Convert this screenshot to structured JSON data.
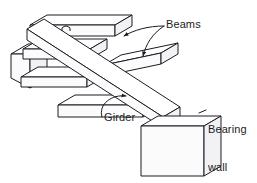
{
  "figure": {
    "kind": "isometric-line-drawing",
    "background_color": "#ffffff",
    "line_color": "#1b1b24",
    "fill_top": "#ffffff",
    "fill_side": "#fbfbfc",
    "fill_end": "#f2f2f4",
    "fill_wall": "#f4f4f6"
  },
  "labels": {
    "beams": "Beams",
    "girder": "Girder",
    "bearing_wall_line1": "Bearing",
    "bearing_wall_line2": "wall",
    "cropped_top_text": ""
  },
  "leaders": {
    "beams_count": 2,
    "girder_count": 1,
    "style": "curved with solid arrowhead"
  },
  "members": [
    {
      "name": "girder",
      "role": "primary diagonal member",
      "orientation": "upper-left to lower-right"
    },
    {
      "name": "beam-upper",
      "role": "transverse beam",
      "orientation": "upper-right to lower-left"
    },
    {
      "name": "beam-lower",
      "role": "transverse beam",
      "orientation": "upper-right to lower-left"
    },
    {
      "name": "beam-left-upper",
      "role": "transverse beam into left wall",
      "orientation": "upper-right to lower-left"
    },
    {
      "name": "bearing-wall-left",
      "role": "support",
      "shape": "block"
    },
    {
      "name": "bearing-wall-right",
      "role": "support",
      "shape": "slab"
    }
  ]
}
